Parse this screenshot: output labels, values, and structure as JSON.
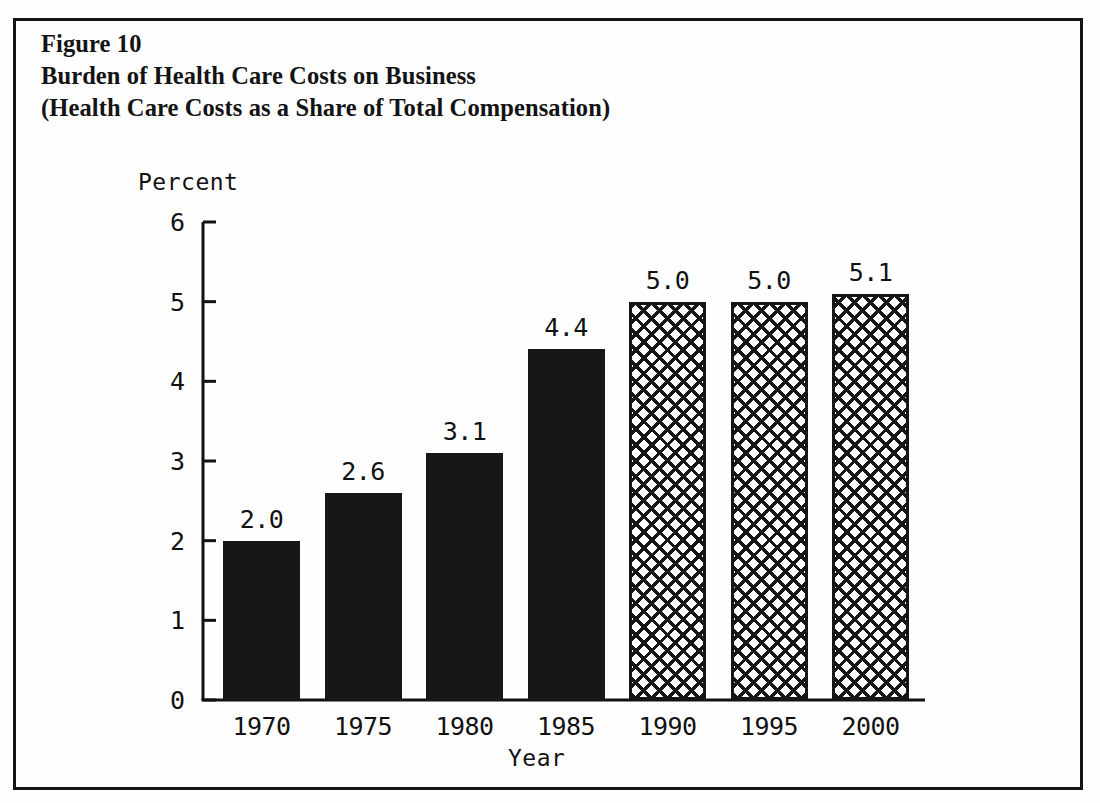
{
  "figure": {
    "caption_lines": [
      "Figure 10",
      "Burden of Health Care Costs on Business",
      "(Health Care Costs as a Share of Total Compensation)"
    ],
    "border_color": "#141414",
    "background_color": "#fefefe"
  },
  "chart_data": {
    "type": "bar",
    "title": "Burden of Health Care Costs on Business",
    "subtitle": "(Health Care Costs as a Share of Total Compensation)",
    "figure_number": "Figure 10",
    "xlabel": "Year",
    "ylabel": "Percent",
    "categories": [
      "1970",
      "1975",
      "1980",
      "1985",
      "1990",
      "1995",
      "2000"
    ],
    "values": [
      2.0,
      2.6,
      3.1,
      4.4,
      5.0,
      5.0,
      5.1
    ],
    "value_labels": [
      "2.0",
      "2.6",
      "3.1",
      "4.4",
      "5.0",
      "5.0",
      "5.1"
    ],
    "series": [
      {
        "name": "Health care costs as a share of total compensation",
        "values": [
          2.0,
          2.6,
          3.1,
          4.4,
          5.0,
          5.0,
          5.1
        ]
      }
    ],
    "bar_styles": [
      "solid",
      "solid",
      "solid",
      "solid",
      "hatch",
      "hatch",
      "hatch"
    ],
    "ylim": [
      0,
      6
    ],
    "ytick_labels": [
      "0",
      "1",
      "2",
      "3",
      "4",
      "5",
      "6"
    ],
    "ytick_values": [
      0,
      1,
      2,
      3,
      4,
      5,
      6
    ],
    "grid": false,
    "legend": "none",
    "bar_fill_color": "#171717",
    "hatch_line_color": "#161616",
    "axis_color": "#121212"
  }
}
